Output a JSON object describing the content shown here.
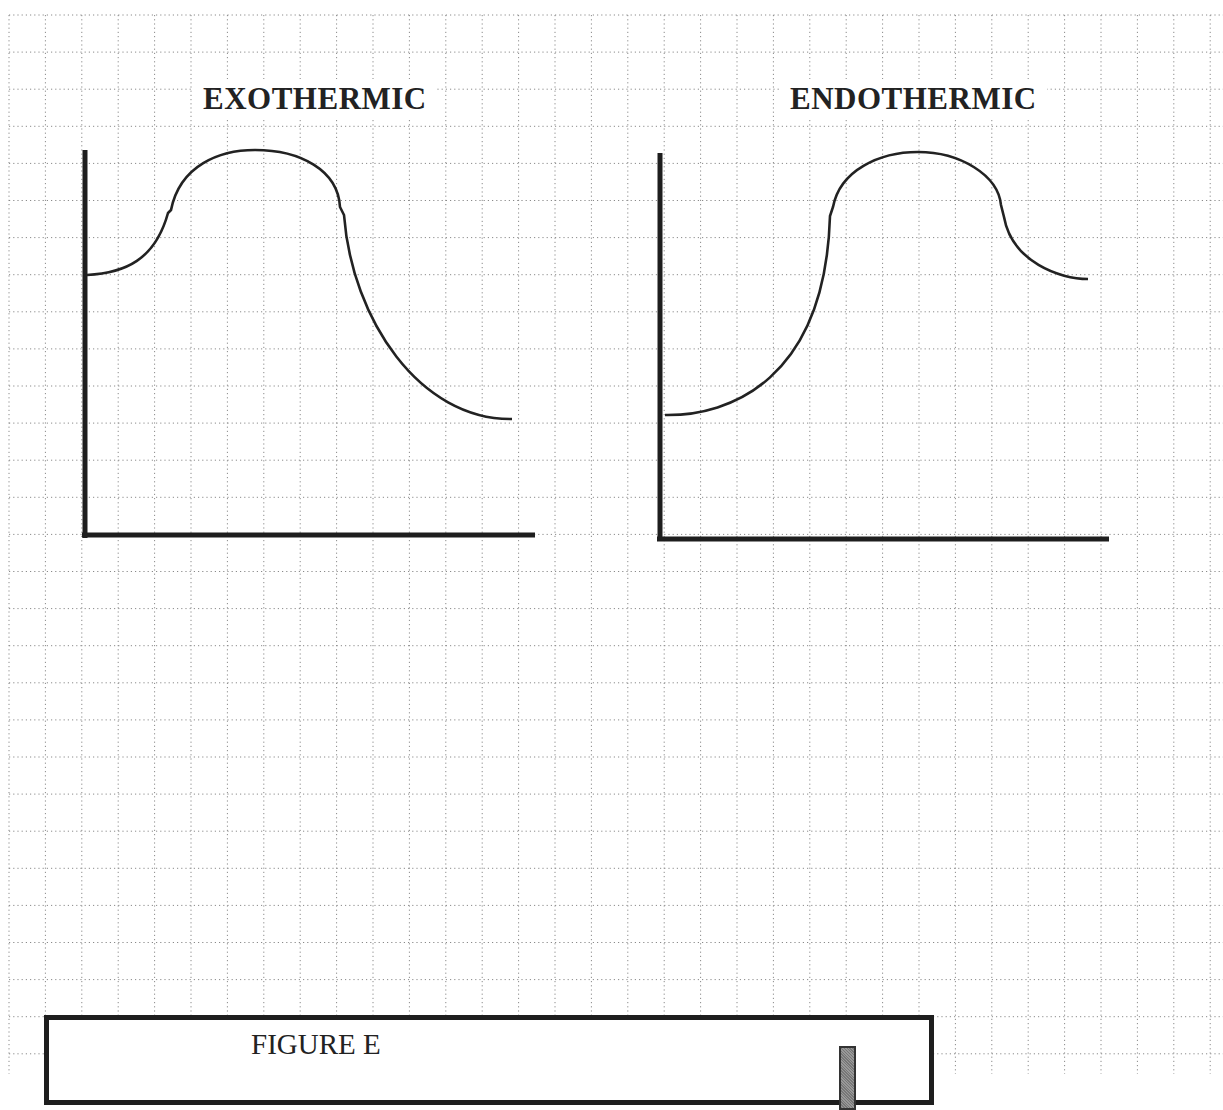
{
  "colors": {
    "background": "#ffffff",
    "grid": "#8a8a8a",
    "ink": "#222222"
  },
  "grid": {
    "origin_x": 9,
    "origin_y": 15,
    "spacing_x": 36.4,
    "spacing_y": 37.1
  },
  "titles": {
    "exothermic": "EXOTHERMIC",
    "endothermic": "ENDOTHERMIC"
  },
  "figure": {
    "caption": "FIGURE E"
  },
  "chart_data": [
    {
      "type": "line",
      "title": "EXOTHERMIC",
      "xlabel": "",
      "ylabel": "",
      "grid": true,
      "description": "Energy profile: reactants start at a medium energy level, rise to an activation peak, and end at a lower product energy level.",
      "points_relative": {
        "reactants_level": 0.68,
        "peak_level": 1.0,
        "products_level": 0.3
      },
      "path_points": [
        [
          0.0,
          0.68
        ],
        [
          0.18,
          0.84
        ],
        [
          0.42,
          1.0
        ],
        [
          0.6,
          0.85
        ],
        [
          1.0,
          0.3
        ]
      ]
    },
    {
      "type": "line",
      "title": "ENDOTHERMIC",
      "xlabel": "",
      "ylabel": "",
      "grid": true,
      "description": "Energy profile: reactants start at a low energy level, rise to an activation peak, and end at a higher product energy level.",
      "points_relative": {
        "reactants_level": 0.32,
        "peak_level": 1.0,
        "products_level": 0.67
      },
      "path_points": [
        [
          0.0,
          0.32
        ],
        [
          0.4,
          0.84
        ],
        [
          0.6,
          1.0
        ],
        [
          0.8,
          0.85
        ],
        [
          1.0,
          0.67
        ]
      ]
    }
  ]
}
